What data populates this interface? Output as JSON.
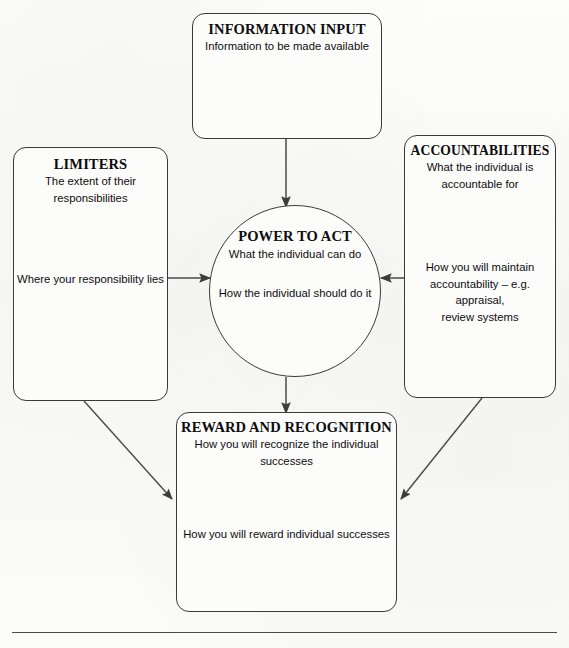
{
  "diagram": {
    "nodes": {
      "information_input": {
        "title": "INFORMATION INPUT",
        "lines": [
          "Information to be made available"
        ]
      },
      "limiters": {
        "title": "LIMITERS",
        "lines": [
          "The extent of their",
          "responsibilities"
        ],
        "lower_lines": [
          "Where your responsibility lies"
        ]
      },
      "accountabilities": {
        "title": "ACCOUNTABILITIES",
        "lines": [
          "What the individual is",
          "accountable for"
        ],
        "lower_lines": [
          "How you will maintain",
          "accountability – e.g. appraisal,",
          "review systems"
        ]
      },
      "power_to_act": {
        "title": "POWER TO ACT",
        "line1": "What the individual can do",
        "line2": "How the individual should do it"
      },
      "reward_recognition": {
        "title": "REWARD AND RECOGNITION",
        "lines": [
          "How you will recognize the individual",
          "successes"
        ],
        "lower_lines": [
          "How you will reward individual successes"
        ]
      }
    },
    "arrows": [
      {
        "name": "information-input-to-power-to-act",
        "from": "information_input",
        "to": "power_to_act",
        "direction": "down"
      },
      {
        "name": "limiters-to-power-to-act",
        "from": "limiters",
        "to": "power_to_act",
        "direction": "right"
      },
      {
        "name": "accountabilities-to-power-to-act",
        "from": "accountabilities",
        "to": "power_to_act",
        "direction": "left"
      },
      {
        "name": "power-to-act-to-reward-recognition",
        "from": "power_to_act",
        "to": "reward_recognition",
        "direction": "down"
      },
      {
        "name": "limiters-to-reward-recognition",
        "from": "limiters",
        "to": "reward_recognition",
        "direction": "diagonal-down-right"
      },
      {
        "name": "accountabilities-to-reward-recognition",
        "from": "accountabilities",
        "to": "reward_recognition",
        "direction": "diagonal-down-left"
      }
    ],
    "colors": {
      "stroke": "#3a3a3a",
      "arrow": "#4a4a4a",
      "text": "#0d0d0d",
      "paper": "#fbfbfa"
    }
  }
}
